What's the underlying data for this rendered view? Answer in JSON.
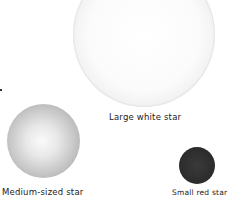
{
  "stars": [
    {
      "id": "large",
      "label": "Large white star",
      "color": "#f5f5f5"
    },
    {
      "id": "medium",
      "label": "Medium-sized star",
      "color": "#bdbdbd"
    },
    {
      "id": "small",
      "label": "Small red star",
      "color": "#2b2b2b"
    }
  ]
}
